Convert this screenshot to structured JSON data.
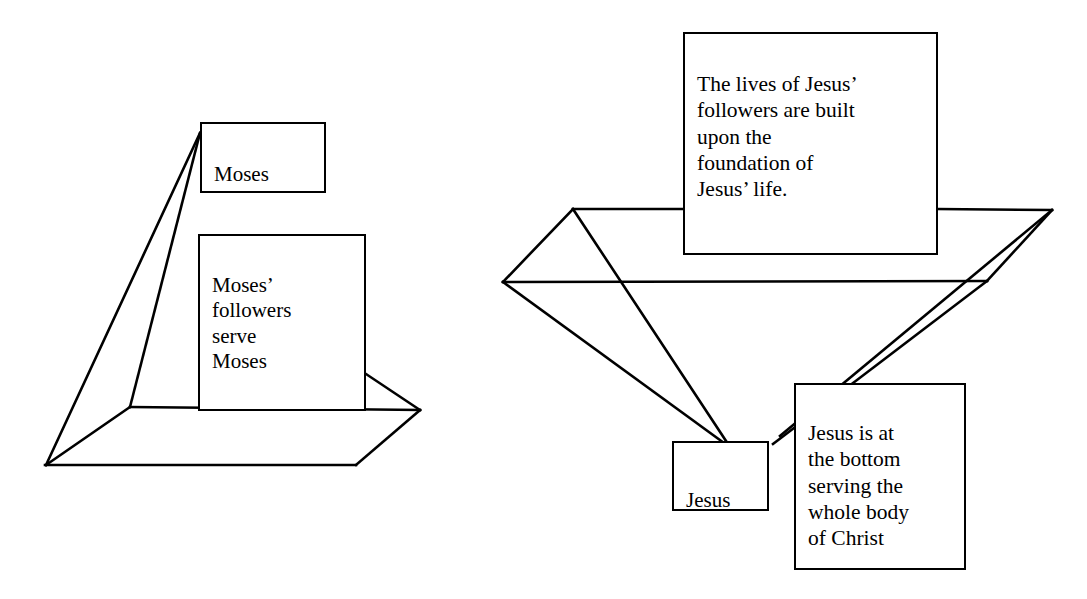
{
  "figure": {
    "background_color": "#ffffff",
    "stroke_color": "#000000",
    "canvas": {
      "width": 1087,
      "height": 599
    }
  },
  "diagrams": [
    {
      "id": "moses-pyramid",
      "name": "Moses upright pyramid",
      "nodes": [
        {
          "id": "moses",
          "label": "Moses"
        },
        {
          "id": "moses-followers",
          "label": "Moses’\nfollowers\nserve\nMoses"
        }
      ]
    },
    {
      "id": "jesus-inverted-pyramid",
      "name": "Jesus inverted pyramid",
      "nodes": [
        {
          "id": "jesus-foundation",
          "label": "The lives of Jesus’\nfollowers are built\nupon the\nfoundation of\nJesus’ life."
        },
        {
          "id": "jesus",
          "label": "Jesus"
        },
        {
          "id": "jesus-bottom",
          "label": "Jesus is at\nthe bottom\nserving the\nwhole body\nof Christ"
        }
      ]
    }
  ],
  "shapes": {
    "left_pyramid": {
      "apex": [
        200,
        133
      ],
      "base_front_left": [
        46,
        465
      ],
      "base_front_right": [
        356,
        465
      ],
      "base_back_left": [
        130,
        407
      ],
      "base_back_right": [
        420,
        410
      ],
      "edges": [
        "M200,133 L46,465",
        "M200,133 L130,407",
        "M46,465 L130,407",
        "M46,465 L356,465",
        "M356,465 L420,410",
        "M130,407 L420,410",
        "M366,374 L420,410",
        "M356,465 L420,410"
      ]
    },
    "right_funnel": {
      "rim_back_left": [
        573,
        209
      ],
      "rim_left": [
        503,
        282
      ],
      "rim_back_right": [
        1052,
        210
      ],
      "rim_right": [
        986,
        281
      ],
      "tip": [
        726,
        442
      ],
      "edges": [
        "M573,209 L503,282",
        "M503,282 L726,442",
        "M573,209 L726,442",
        "M1052,210 L986,281",
        "M986,281 L726,442",
        "M1052,210 L726,442",
        "M573,209 L683,209",
        "M938,209 L1052,210",
        "M503,282 L986,281"
      ]
    }
  }
}
